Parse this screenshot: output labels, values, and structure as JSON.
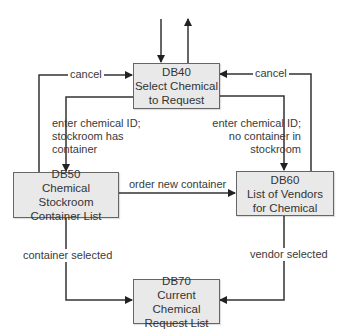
{
  "diagram": {
    "type": "dialog map",
    "nodes": [
      {
        "id": "DB40",
        "code": "DB40",
        "title_line1": "Select Chemical",
        "title_line2": "to Request"
      },
      {
        "id": "DB50",
        "code": "DB50",
        "title_line1": "Chemical Stockroom",
        "title_line2": "Container List"
      },
      {
        "id": "DB60",
        "code": "DB60",
        "title_line1": "List of Vendors",
        "title_line2": "for Chemical"
      },
      {
        "id": "DB70",
        "code": "DB70",
        "title_line1": "Current Chemical",
        "title_line2": "Request List"
      }
    ],
    "edges": [
      {
        "from": "external",
        "to": "DB40",
        "label": ""
      },
      {
        "from": "DB40",
        "to": "external",
        "label": ""
      },
      {
        "from": "DB50",
        "to": "DB40",
        "label": "cancel"
      },
      {
        "from": "DB60",
        "to": "DB40",
        "label": "cancel"
      },
      {
        "from": "DB40",
        "to": "DB50",
        "label_lines": [
          "enter chemical ID;",
          "stockroom has",
          "container"
        ]
      },
      {
        "from": "DB40",
        "to": "DB60",
        "label_lines": [
          "enter chemical ID;",
          "no container in",
          "stockroom"
        ]
      },
      {
        "from": "DB50",
        "to": "DB60",
        "label": "order new container"
      },
      {
        "from": "DB50",
        "to": "DB70",
        "label": "container selected"
      },
      {
        "from": "DB60",
        "to": "DB70",
        "label": "vendor selected"
      }
    ]
  },
  "labels": {
    "cancel_left": "cancel",
    "cancel_right": "cancel",
    "to_db50": [
      "enter chemical ID;",
      "stockroom has",
      "container"
    ],
    "to_db60": [
      "enter chemical ID;",
      "no container in",
      "stockroom"
    ],
    "order_new": "order new container",
    "container_selected": "container selected",
    "vendor_selected": "vendor selected"
  },
  "colors": {
    "box_fill": "#e9e9e9",
    "box_border": "#666666",
    "line": "#333333"
  }
}
